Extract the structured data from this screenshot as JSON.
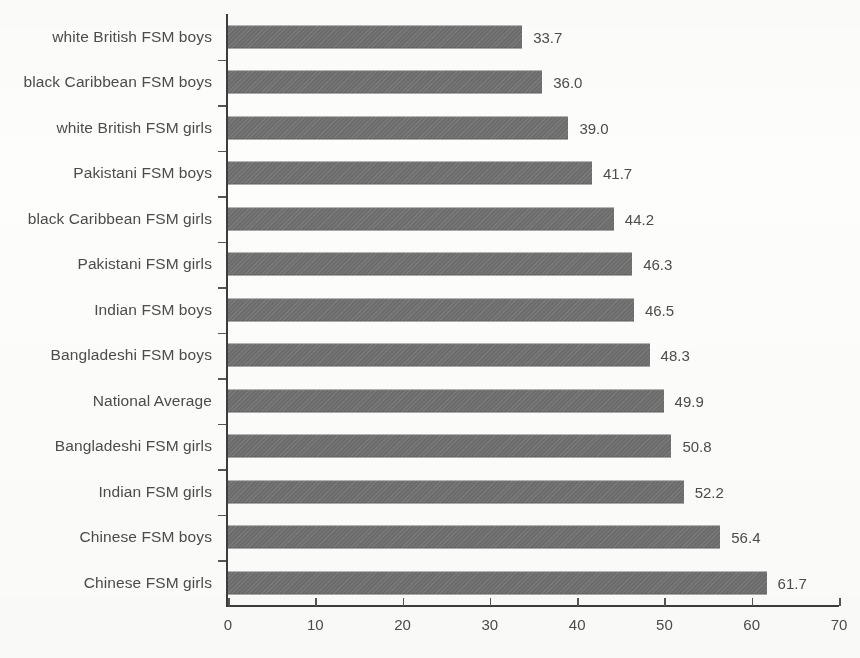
{
  "chart_data": {
    "type": "bar",
    "orientation": "horizontal",
    "title": "",
    "subtitle": "",
    "xlabel": "",
    "ylabel": "",
    "xlim": [
      0,
      70
    ],
    "xticks": [
      0,
      10,
      20,
      30,
      40,
      50,
      60,
      70
    ],
    "grid": false,
    "legend": null,
    "bar_color": "#6d6d6d",
    "categories": [
      "white British FSM boys",
      "black Caribbean FSM boys",
      "white British FSM girls",
      "Pakistani FSM boys",
      "black Caribbean FSM girls",
      "Pakistani FSM girls",
      "Indian FSM boys",
      "Bangladeshi FSM boys",
      "National Average",
      "Bangladeshi FSM girls",
      "Indian FSM girls",
      "Chinese FSM boys",
      "Chinese FSM girls"
    ],
    "values": [
      33.7,
      36.0,
      39.0,
      41.7,
      44.2,
      46.3,
      46.5,
      48.3,
      49.9,
      50.8,
      52.2,
      56.4,
      61.7
    ],
    "data_labels": [
      "33.7",
      "36.0",
      "39.0",
      "41.7",
      "44.2",
      "46.3",
      "46.5",
      "48.3",
      "49.9",
      "50.8",
      "52.2",
      "56.4",
      "61.7"
    ],
    "xtick_labels": [
      "0",
      "10",
      "20",
      "30",
      "40",
      "50",
      "60",
      "70"
    ]
  }
}
